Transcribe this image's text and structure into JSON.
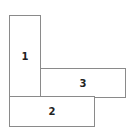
{
  "diagram": {
    "rectangles": [
      {
        "label": "1",
        "x": 9,
        "y": 15,
        "width": 32,
        "height": 82
      },
      {
        "label": "2",
        "x": 9,
        "y": 96,
        "width": 86,
        "height": 31
      },
      {
        "label": "3",
        "x": 40,
        "y": 68,
        "width": 86,
        "height": 30
      }
    ],
    "colors": {
      "border": "#8a8a8a",
      "text": "#222222",
      "background": "#ffffff"
    }
  }
}
